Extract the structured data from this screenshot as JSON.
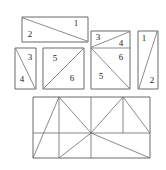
{
  "figure": {
    "background_color": "#ffffff",
    "stroke_color": "#5a5a5a",
    "line_color": "#6b6b6b",
    "label_color": "#1a1a1a",
    "pieces": [
      {
        "id": "piece-group-top-left",
        "shape": "rectangle-with-diagonal",
        "description": "wide horizontal rectangle split by a diagonal from top-left to bottom-right",
        "outline": "22,17 88,17 88,42 22,42",
        "cut": "23,18 87,41",
        "labels": [
          {
            "text": "2",
            "x": 30,
            "y": 35
          },
          {
            "text": "1",
            "x": 76,
            "y": 24
          }
        ]
      },
      {
        "id": "piece-group-left-tall",
        "shape": "rectangle-with-diagonal",
        "description": "narrow tall rectangle split by a diagonal from top-left to bottom-right",
        "outline": "15,48 36,48 36,89 15,89",
        "cut": "16,49 35,88",
        "labels": [
          {
            "text": "3",
            "x": 30,
            "y": 58
          },
          {
            "text": "4",
            "x": 22,
            "y": 80
          }
        ]
      },
      {
        "id": "piece-group-square",
        "shape": "square-with-diagonal",
        "description": "square split by a diagonal from bottom-left to top-right",
        "outline": "43,48 84,48 84,89 43,89",
        "cut": "44,88 83,49",
        "labels": [
          {
            "text": "5",
            "x": 55,
            "y": 59
          },
          {
            "text": "6",
            "x": 72,
            "y": 79
          }
        ]
      },
      {
        "id": "piece-group-composite",
        "shape": "rectangle-with-three-cuts",
        "description": "tall rectangle divided into an upper band with a diagonal and a lower square with a diagonal",
        "outline": "91,31 130,31 130,89 91,89",
        "cuts": [
          "91,48 130,48",
          "92,47 129,32",
          "92,49 129,88"
        ],
        "labels": [
          {
            "text": "3",
            "x": 98,
            "y": 38
          },
          {
            "text": "4",
            "x": 121,
            "y": 44
          },
          {
            "text": "6",
            "x": 121,
            "y": 58
          },
          {
            "text": "5",
            "x": 101,
            "y": 77
          }
        ]
      },
      {
        "id": "piece-group-right-tall",
        "shape": "rectangle-with-diagonal",
        "description": "narrow tall rectangle split by a diagonal from bottom-left to top-right",
        "outline": "138,31 158,31 158,89 138,89",
        "cut": "139,88 157,32",
        "labels": [
          {
            "text": "1",
            "x": 144,
            "y": 39
          },
          {
            "text": "2",
            "x": 152,
            "y": 81
          }
        ]
      }
    ],
    "assembly": {
      "id": "assembled-rectangle",
      "description": "large rectangle showing all six pieces reassembled with construction lines converging on a central hub",
      "outline": "33,97 150,97 150,158 33,158",
      "lines": [
        "59,97 59,158",
        "123,97 123,133",
        "91,97 91,158",
        "33,133 150,133",
        "33,158 59,97",
        "59,97 91,133",
        "91,133 123,97",
        "123,97 150,133",
        "91,133 59,158",
        "91,133 150,158",
        "33,133 91,133"
      ]
    }
  }
}
